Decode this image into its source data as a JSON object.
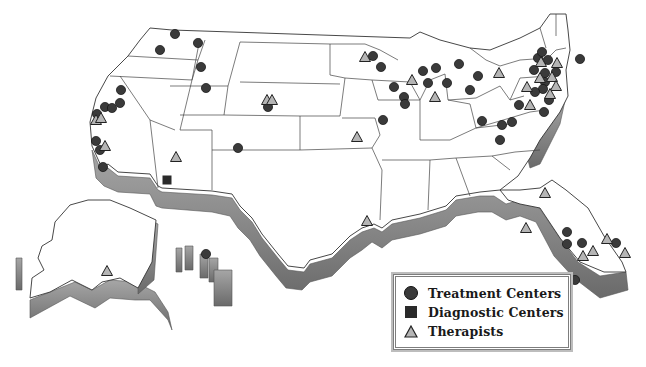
{
  "map": {
    "title": "",
    "region": "United States (with Alaska and Hawaii insets)",
    "style": "3D extruded outline map, grayscale",
    "colors": {
      "land": "#ffffff",
      "border": "#333333",
      "extrusion_light": "#9a9a9a",
      "extrusion_dark": "#6e6e6e",
      "circle": "#3a3a3a",
      "square": "#2a2a2a",
      "triangle_fill": "#b5b5b5"
    }
  },
  "legend": {
    "items": [
      {
        "symbol": "circle",
        "label": "Treatment Centers"
      },
      {
        "symbol": "square",
        "label": "Diagnostic Centers"
      },
      {
        "symbol": "triangle",
        "label": "Therapists"
      }
    ]
  },
  "markers": {
    "treatment_centers": [
      [
        175,
        34
      ],
      [
        198,
        43
      ],
      [
        160,
        50
      ],
      [
        201,
        67
      ],
      [
        121,
        90
      ],
      [
        105,
        107
      ],
      [
        112,
        108
      ],
      [
        120,
        103
      ],
      [
        97,
        114
      ],
      [
        206,
        88
      ],
      [
        268,
        107
      ],
      [
        238,
        148
      ],
      [
        96,
        141
      ],
      [
        100,
        150
      ],
      [
        103,
        167
      ],
      [
        373,
        56
      ],
      [
        381,
        67
      ],
      [
        423,
        71
      ],
      [
        436,
        68
      ],
      [
        459,
        64
      ],
      [
        394,
        87
      ],
      [
        404,
        97
      ],
      [
        405,
        104
      ],
      [
        383,
        120
      ],
      [
        428,
        83
      ],
      [
        447,
        83
      ],
      [
        478,
        76
      ],
      [
        482,
        121
      ],
      [
        502,
        125
      ],
      [
        512,
        122
      ],
      [
        519,
        105
      ],
      [
        500,
        140
      ],
      [
        544,
        112
      ],
      [
        545,
        73
      ],
      [
        538,
        58
      ],
      [
        542,
        52
      ],
      [
        548,
        60
      ],
      [
        534,
        70
      ],
      [
        556,
        72
      ],
      [
        545,
        82
      ],
      [
        543,
        89
      ],
      [
        535,
        92
      ],
      [
        549,
        100
      ],
      [
        470,
        90
      ],
      [
        580,
        59
      ],
      [
        575,
        280
      ],
      [
        567,
        232
      ],
      [
        567,
        244
      ],
      [
        582,
        243
      ],
      [
        616,
        243
      ],
      [
        206,
        254
      ]
    ],
    "diagnostic_centers": [
      [
        167,
        180
      ]
    ],
    "therapists": [
      [
        96,
        120
      ],
      [
        101,
        118
      ],
      [
        105,
        146
      ],
      [
        176,
        157
      ],
      [
        267,
        100
      ],
      [
        272,
        100
      ],
      [
        357,
        137
      ],
      [
        365,
        57
      ],
      [
        412,
        80
      ],
      [
        435,
        97
      ],
      [
        499,
        73
      ],
      [
        527,
        87
      ],
      [
        541,
        62
      ],
      [
        557,
        63
      ],
      [
        540,
        78
      ],
      [
        552,
        77
      ],
      [
        556,
        86
      ],
      [
        550,
        94
      ],
      [
        530,
        105
      ],
      [
        583,
        256
      ],
      [
        545,
        193
      ],
      [
        526,
        228
      ],
      [
        607,
        239
      ],
      [
        593,
        251
      ],
      [
        625,
        253
      ],
      [
        367,
        221
      ],
      [
        107,
        271
      ]
    ]
  }
}
